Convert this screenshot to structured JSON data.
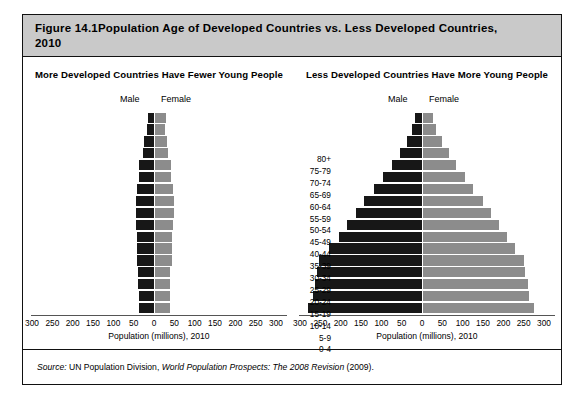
{
  "figure": {
    "number_label": "Figure 14.1",
    "title_line1": "Population Age of Developed Countries vs. Less Developed Countries,",
    "title_line2": "2010",
    "source_prefix": "Source:",
    "source_org": " UN Population Division, ",
    "source_work": "World Population Prospects: The 2008 Revision",
    "source_year": " (2009)."
  },
  "colors": {
    "male_bar": "#171717",
    "female_bar": "#8c8c8c",
    "header_band": "#c9c9c9",
    "frame_border": "#111111"
  },
  "legend": {
    "male": "Male",
    "female": "Female"
  },
  "axis": {
    "caption": "Population (millions), 2010",
    "ticks": [
      "300",
      "250",
      "200",
      "150",
      "100",
      "50",
      "0",
      "50",
      "100",
      "150",
      "200",
      "250",
      "300"
    ],
    "min": -300,
    "max": 300
  },
  "age_groups": [
    "80+",
    "75-79",
    "70-74",
    "65-69",
    "60-64",
    "55-59",
    "50-54",
    "45-49",
    "40-44",
    "35-39",
    "30-34",
    "25-29",
    "20-24",
    "15-19",
    "10-14",
    "5-9",
    "0-4"
  ],
  "panels": {
    "left": {
      "title": "More Developed Countries Have Fewer Young People"
    },
    "right": {
      "title": "Less Developed Countries Have More Young People"
    }
  },
  "chart_data": [
    {
      "type": "bar",
      "title": "More Developed Countries Have Fewer Young People",
      "subtype": "population-pyramid",
      "orientation": "horizontal-diverging",
      "xlabel": "Population (millions), 2010",
      "ylabel": "",
      "xlim": [
        -300,
        300
      ],
      "xticks": [
        -300,
        -250,
        -200,
        -150,
        -100,
        -50,
        0,
        50,
        100,
        150,
        200,
        250,
        300
      ],
      "xticklabels": [
        "300",
        "250",
        "200",
        "150",
        "100",
        "50",
        "0",
        "50",
        "100",
        "150",
        "200",
        "250",
        "300"
      ],
      "grid": false,
      "legend": [
        "Male",
        "Female"
      ],
      "legend_position": "top-center",
      "categories": [
        "80+",
        "75-79",
        "70-74",
        "65-69",
        "60-64",
        "55-59",
        "50-54",
        "45-49",
        "40-44",
        "35-39",
        "30-34",
        "25-29",
        "20-24",
        "15-19",
        "10-14",
        "5-9",
        "0-4"
      ],
      "series": [
        {
          "name": "Male",
          "values": [
            14,
            18,
            24,
            28,
            36,
            38,
            42,
            45,
            45,
            44,
            43,
            43,
            42,
            40,
            39,
            38,
            38
          ]
        },
        {
          "name": "Female",
          "values": [
            26,
            25,
            29,
            32,
            39,
            40,
            44,
            46,
            46,
            44,
            43,
            42,
            41,
            38,
            37,
            36,
            36
          ]
        }
      ]
    },
    {
      "type": "bar",
      "title": "Less Developed Countries Have More Young People",
      "subtype": "population-pyramid",
      "orientation": "horizontal-diverging",
      "xlabel": "Population (millions), 2010",
      "ylabel": "",
      "xlim": [
        -300,
        300
      ],
      "xticks": [
        -300,
        -250,
        -200,
        -150,
        -100,
        -50,
        0,
        50,
        100,
        150,
        200,
        250,
        300
      ],
      "xticklabels": [
        "300",
        "250",
        "200",
        "150",
        "100",
        "50",
        "0",
        "50",
        "100",
        "150",
        "200",
        "250",
        "300"
      ],
      "grid": false,
      "legend": [
        "Male",
        "Female"
      ],
      "legend_position": "top-center",
      "categories": [
        "80+",
        "75-79",
        "70-74",
        "65-69",
        "60-64",
        "55-59",
        "50-54",
        "45-49",
        "40-44",
        "35-39",
        "30-34",
        "25-29",
        "20-24",
        "15-19",
        "10-14",
        "5-9",
        "0-4"
      ],
      "series": [
        {
          "name": "Male",
          "values": [
            16,
            24,
            37,
            54,
            74,
            96,
            118,
            142,
            163,
            184,
            205,
            228,
            253,
            258,
            264,
            268,
            280
          ]
        },
        {
          "name": "Female",
          "values": [
            24,
            32,
            46,
            63,
            82,
            103,
            124,
            147,
            167,
            187,
            206,
            227,
            249,
            252,
            257,
            261,
            272
          ]
        }
      ]
    }
  ]
}
